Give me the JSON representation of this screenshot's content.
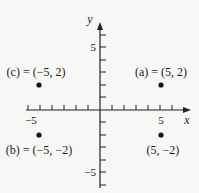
{
  "diagram": {
    "type": "coordinate-plane",
    "axes": {
      "x": {
        "label": "x",
        "tick_labels": [
          {
            "value": -5,
            "text": "−5"
          },
          {
            "value": 5,
            "text": "5"
          }
        ],
        "range": [
          -6,
          6
        ]
      },
      "y": {
        "label": "y",
        "tick_labels": [
          {
            "value": 5,
            "text": "5"
          },
          {
            "value": -5,
            "text": "−5"
          }
        ],
        "range": [
          -6,
          6
        ]
      }
    },
    "points": [
      {
        "id": "a",
        "x": 5,
        "y": 2,
        "label": "(a) = (5, 2)"
      },
      {
        "id": "b",
        "x": -5,
        "y": -2,
        "label": "(b) = (−5, −2)"
      },
      {
        "id": "c",
        "x": -5,
        "y": 2,
        "label": "(c) = (−5, 2)"
      },
      {
        "id": "d",
        "x": 5,
        "y": -2,
        "label": "(5, −2)"
      }
    ]
  }
}
